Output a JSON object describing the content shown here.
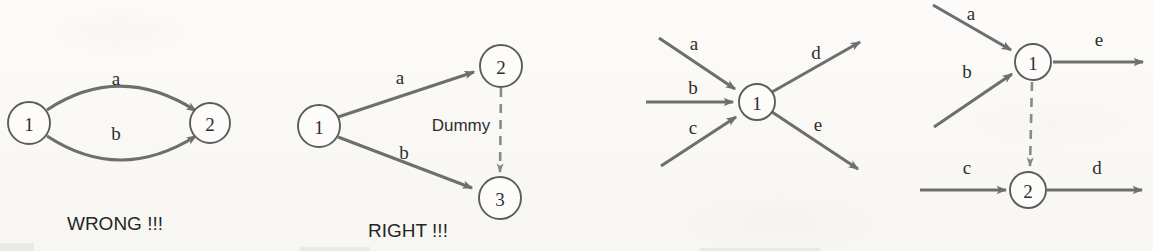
{
  "figure": {
    "kind": "activity-on-arrow-network-diagram",
    "background_color": "#fbfaf8",
    "line_color": "#6e6e6e",
    "dummy_color": "#8a8a8a",
    "text_color": "#2e2e2e"
  },
  "panels": [
    {
      "id": "panel-wrong",
      "caption": "WRONG !!!",
      "nodes": [
        {
          "label": "1",
          "cx": 29,
          "cy": 123,
          "r": 21
        },
        {
          "label": "2",
          "cx": 210,
          "cy": 123,
          "r": 20
        }
      ],
      "edges": [
        {
          "label": "a",
          "from": "1",
          "to": "2",
          "style": "curve-up",
          "label_x": 116,
          "label_y": 85
        },
        {
          "label": "b",
          "from": "1",
          "to": "2",
          "style": "curve-down",
          "label_x": 116,
          "label_y": 140
        }
      ]
    },
    {
      "id": "panel-right",
      "caption": "RIGHT !!!",
      "nodes": [
        {
          "label": "1",
          "cx": 319,
          "cy": 126,
          "r": 21
        },
        {
          "label": "2",
          "cx": 501,
          "cy": 66,
          "r": 21
        },
        {
          "label": "3",
          "cx": 500,
          "cy": 198,
          "r": 21
        }
      ],
      "edges": [
        {
          "label": "a",
          "from": "1",
          "to": "2",
          "style": "straight",
          "label_x": 400,
          "label_y": 84
        },
        {
          "label": "b",
          "from": "1",
          "to": "3",
          "style": "straight",
          "label_x": 404,
          "label_y": 159
        },
        {
          "label": "Dummy",
          "from": "2",
          "to": "3",
          "style": "dashed",
          "label_x": 461,
          "label_y": 131
        }
      ]
    },
    {
      "id": "panel-merge-burst",
      "caption": "",
      "nodes": [
        {
          "label": "1",
          "cx": 757,
          "cy": 102,
          "r": 18
        }
      ],
      "edges": [
        {
          "label": "a",
          "direction": "in",
          "style": "straight",
          "label_x": 694,
          "label_y": 50
        },
        {
          "label": "b",
          "direction": "in",
          "style": "straight",
          "label_x": 693,
          "label_y": 94
        },
        {
          "label": "c",
          "direction": "in",
          "style": "straight",
          "label_x": 693,
          "label_y": 134
        },
        {
          "label": "d",
          "direction": "out",
          "style": "straight",
          "label_x": 816,
          "label_y": 59
        },
        {
          "label": "e",
          "direction": "out",
          "style": "straight",
          "label_x": 818,
          "label_y": 131
        }
      ]
    },
    {
      "id": "panel-split-dummy",
      "caption": "",
      "nodes": [
        {
          "label": "1",
          "cx": 1033,
          "cy": 62,
          "r": 18
        },
        {
          "label": "2",
          "cx": 1028,
          "cy": 190,
          "r": 18
        }
      ],
      "edges": [
        {
          "label": "a",
          "direction": "in",
          "to": "1",
          "style": "straight",
          "label_x": 971,
          "label_y": 20
        },
        {
          "label": "b",
          "direction": "in",
          "to": "1",
          "style": "straight",
          "label_x": 967,
          "label_y": 78
        },
        {
          "label": "e",
          "direction": "out",
          "from": "1",
          "style": "straight",
          "label_x": 1099,
          "label_y": 46
        },
        {
          "label": "c",
          "direction": "in",
          "to": "2",
          "style": "straight",
          "label_x": 967,
          "label_y": 174
        },
        {
          "label": "d",
          "direction": "out",
          "from": "2",
          "style": "straight",
          "label_x": 1097,
          "label_y": 174
        },
        {
          "label": "",
          "from": "1",
          "to": "2",
          "style": "dashed"
        }
      ]
    }
  ]
}
